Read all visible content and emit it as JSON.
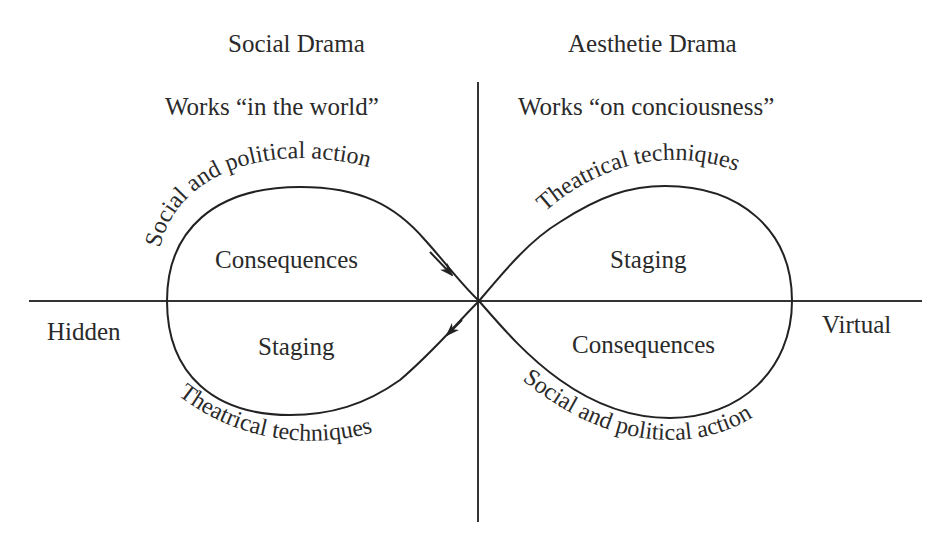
{
  "diagram": {
    "type": "infinity-loop quadrant diagram",
    "headers": {
      "left_title": "Social Drama",
      "left_subtitle": "Works “in the world”",
      "right_title": "Aesthetie Drama",
      "right_subtitle": "Works “on conciousness”"
    },
    "axis_labels": {
      "left": "Hidden",
      "right": "Virtual"
    },
    "left_loop": {
      "upper_region": "Consequences",
      "lower_region": "Staging",
      "upper_arc_label": "Social and political action",
      "lower_arc_label": "Theatrical techniques",
      "arrows": [
        "upper-right into center",
        "center out to lower-left"
      ]
    },
    "right_loop": {
      "upper_region": "Staging",
      "lower_region": "Consequences",
      "upper_arc_label": "Theatrical techniques",
      "lower_arc_label": "Social and political action"
    },
    "colors": {
      "line": "#222222",
      "text": "#2a2a2a",
      "background": "#ffffff"
    }
  }
}
